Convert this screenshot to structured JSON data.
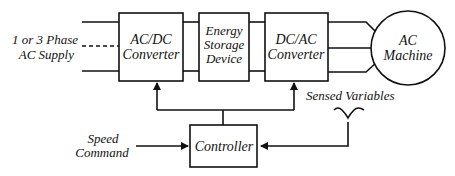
{
  "diagram": {
    "type": "block-diagram",
    "inputs": {
      "supply": {
        "line1": "1 or 3 Phase",
        "line2": "AC Supply"
      },
      "speed_command": {
        "line1": "Speed",
        "line2": "Command"
      }
    },
    "blocks": {
      "acdc": {
        "line1": "AC/DC",
        "line2": "Converter"
      },
      "storage": {
        "line1": "Energy",
        "line2": "Storage",
        "line3": "Device"
      },
      "dcac": {
        "line1": "DC/AC",
        "line2": "Converter"
      },
      "machine": {
        "line1": "AC",
        "line2": "Machine"
      },
      "controller": {
        "label": "Controller"
      }
    },
    "annotations": {
      "sensed": "Sensed Variables"
    },
    "colors": {
      "line": "#111111",
      "background": "#ffffff"
    }
  }
}
